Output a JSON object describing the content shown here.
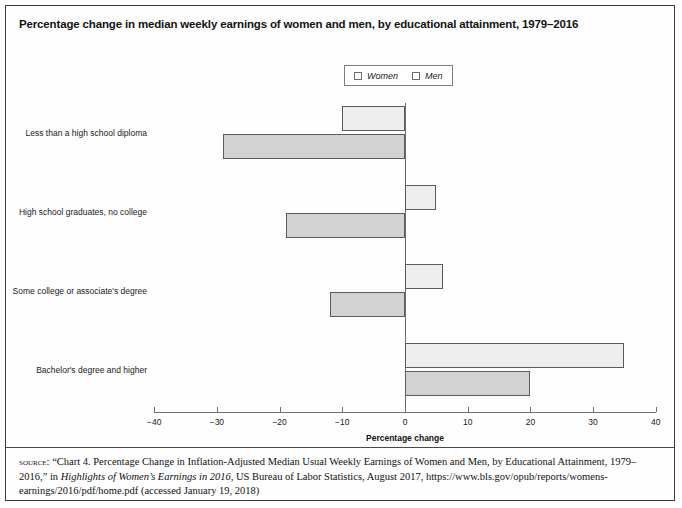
{
  "figure": {
    "title": "Percentage change in median weekly earnings of women and men, by educational attainment, 1979–2016"
  },
  "legend": {
    "position": "top-center",
    "entries": [
      {
        "label": "Women",
        "swatch_color": "#eeeeee",
        "icon": "legend-swatch-women"
      },
      {
        "label": "Men",
        "swatch_color": "#d2d2d2",
        "icon": "legend-swatch-men"
      }
    ]
  },
  "chart_data": {
    "type": "bar",
    "orientation": "horizontal",
    "title": "Percentage change in median weekly earnings of women and men, by educational attainment, 1979–2016",
    "xlabel": "Percentage change",
    "ylabel": "",
    "xlim": [
      -40,
      40
    ],
    "xticks": [
      -40,
      -30,
      -20,
      -10,
      0,
      10,
      20,
      30,
      40
    ],
    "xticklabels": [
      "−40",
      "−30",
      "−20",
      "−10",
      "0",
      "10",
      "20",
      "30",
      "40"
    ],
    "grid": false,
    "categories": [
      "Less than a high school diploma",
      "High school graduates, no college",
      "Some college or associate's degree",
      "Bachelor's degree and higher"
    ],
    "series": [
      {
        "name": "Women",
        "color": "#eeeeee",
        "values": [
          -10,
          5,
          6,
          35
        ]
      },
      {
        "name": "Men",
        "color": "#d2d2d2",
        "values": [
          -29,
          -19,
          -12,
          20
        ]
      }
    ]
  },
  "source": {
    "label": "source:",
    "text_part1": " “Chart 4. Percentage Change in Inflation-Adjusted Median Usual Weekly Earnings of Women and Men, by Educational Attainment, 1979–2016,” in ",
    "text_italic": "Highlights of Women’s Earnings in 2016",
    "text_part2": ", US Bureau of Labor Statistics, August 2017, https://www.bls.gov/opub/reports/womens-earnings/2016/pdf/home.pdf (accessed January 19, 2018)"
  }
}
